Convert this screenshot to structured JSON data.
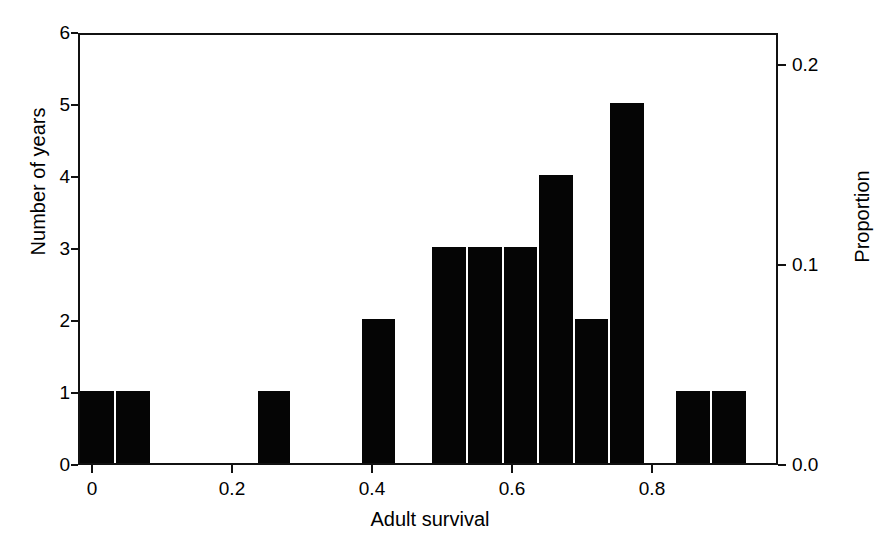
{
  "chart_data": {
    "type": "bar",
    "title": "",
    "subtitle": "",
    "xlabel": "Adult survival",
    "ylabel": "Number of years",
    "ylabel_secondary": "Proportion",
    "xlim": [
      -0.02,
      0.98
    ],
    "ylim": [
      0,
      6
    ],
    "ylim_secondary": [
      0.0,
      0.216
    ],
    "grid": false,
    "legend": null,
    "bar_color": "#050505",
    "frame_color": "#111111",
    "background": "#ffffff",
    "bin_width": 0.0357,
    "xticks": [
      {
        "value": 0,
        "label": "0"
      },
      {
        "value": 0.2,
        "label": "0.2"
      },
      {
        "value": 0.4,
        "label": "0.4"
      },
      {
        "value": 0.6,
        "label": "0.6"
      },
      {
        "value": 0.8,
        "label": "0.8"
      }
    ],
    "yticks": [
      {
        "value": 0,
        "label": "0"
      },
      {
        "value": 1,
        "label": "1"
      },
      {
        "value": 2,
        "label": "2"
      },
      {
        "value": 3,
        "label": "3"
      },
      {
        "value": 4,
        "label": "4"
      },
      {
        "value": 5,
        "label": "5"
      },
      {
        "value": 6,
        "label": "6"
      }
    ],
    "yticks_secondary": [
      {
        "value": 0.0,
        "label": "0.0"
      },
      {
        "value": 0.1,
        "label": "0.1"
      },
      {
        "value": 0.2,
        "label": "0.2"
      }
    ],
    "bins": [
      {
        "x0": 0.0,
        "x1": 0.036,
        "count": 1,
        "proportion": 0.037
      },
      {
        "x0": 0.036,
        "x1": 0.071,
        "count": 1,
        "proportion": 0.037
      },
      {
        "x0": 0.071,
        "x1": 0.107,
        "count": 0,
        "proportion": 0.0
      },
      {
        "x0": 0.107,
        "x1": 0.143,
        "count": 0,
        "proportion": 0.0
      },
      {
        "x0": 0.143,
        "x1": 0.179,
        "count": 0,
        "proportion": 0.0
      },
      {
        "x0": 0.179,
        "x1": 0.214,
        "count": 0,
        "proportion": 0.0
      },
      {
        "x0": 0.214,
        "x1": 0.25,
        "count": 0,
        "proportion": 0.0
      },
      {
        "x0": 0.25,
        "x1": 0.286,
        "count": 1,
        "proportion": 0.037
      },
      {
        "x0": 0.286,
        "x1": 0.321,
        "count": 0,
        "proportion": 0.0
      },
      {
        "x0": 0.321,
        "x1": 0.357,
        "count": 0,
        "proportion": 0.0
      },
      {
        "x0": 0.357,
        "x1": 0.393,
        "count": 0,
        "proportion": 0.0
      },
      {
        "x0": 0.393,
        "x1": 0.429,
        "count": 2,
        "proportion": 0.074
      },
      {
        "x0": 0.429,
        "x1": 0.464,
        "count": 0,
        "proportion": 0.0
      },
      {
        "x0": 0.464,
        "x1": 0.5,
        "count": 0,
        "proportion": 0.0
      },
      {
        "x0": 0.5,
        "x1": 0.536,
        "count": 3,
        "proportion": 0.111
      },
      {
        "x0": 0.536,
        "x1": 0.571,
        "count": 3,
        "proportion": 0.111
      },
      {
        "x0": 0.571,
        "x1": 0.607,
        "count": 3,
        "proportion": 0.111
      },
      {
        "x0": 0.607,
        "x1": 0.643,
        "count": 4,
        "proportion": 0.148
      },
      {
        "x0": 0.643,
        "x1": 0.679,
        "count": 2,
        "proportion": 0.074
      },
      {
        "x0": 0.679,
        "x1": 0.714,
        "count": 5,
        "proportion": 0.185
      },
      {
        "x0": 0.714,
        "x1": 0.75,
        "count": 0,
        "proportion": 0.0
      },
      {
        "x0": 0.75,
        "x1": 0.786,
        "count": 0,
        "proportion": 0.0
      },
      {
        "x0": 0.786,
        "x1": 0.821,
        "count": 0,
        "proportion": 0.0
      },
      {
        "x0": 0.821,
        "x1": 0.857,
        "count": 1,
        "proportion": 0.037
      },
      {
        "x0": 0.857,
        "x1": 0.893,
        "count": 1,
        "proportion": 0.037
      },
      {
        "x0": 0.893,
        "x1": 0.929,
        "count": 0,
        "proportion": 0.0
      }
    ],
    "bars_drawn": [
      {
        "left_px": 0,
        "width_px": 34,
        "height_units": 1
      },
      {
        "left_px": 36,
        "width_px": 34,
        "height_units": 1
      },
      {
        "left_px": 178,
        "width_px": 32,
        "height_units": 1
      },
      {
        "left_px": 282,
        "width_px": 33,
        "height_units": 2
      },
      {
        "left_px": 352,
        "width_px": 34,
        "height_units": 3
      },
      {
        "left_px": 388,
        "width_px": 34,
        "height_units": 3
      },
      {
        "left_px": 424,
        "width_px": 33,
        "height_units": 3
      },
      {
        "left_px": 459,
        "width_px": 34,
        "height_units": 4
      },
      {
        "left_px": 495,
        "width_px": 33,
        "height_units": 2
      },
      {
        "left_px": 530,
        "width_px": 34,
        "height_units": 5
      },
      {
        "left_px": 596,
        "width_px": 34,
        "height_units": 1
      },
      {
        "left_px": 632,
        "width_px": 34,
        "height_units": 1
      }
    ]
  }
}
